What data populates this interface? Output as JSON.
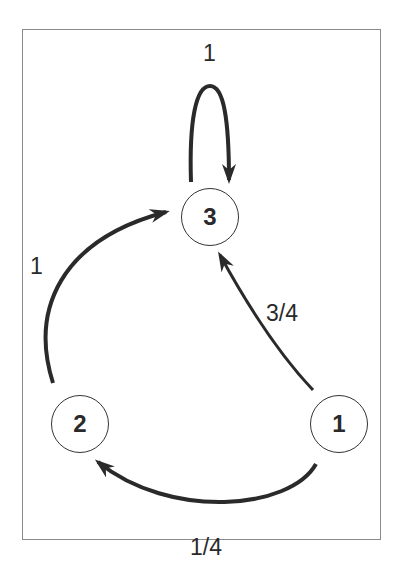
{
  "diagram": {
    "type": "markov-chain-state-diagram",
    "nodes": [
      {
        "id": "1",
        "label": "1"
      },
      {
        "id": "2",
        "label": "2"
      },
      {
        "id": "3",
        "label": "3"
      }
    ],
    "edges": [
      {
        "from": "3",
        "to": "3",
        "label": "1"
      },
      {
        "from": "2",
        "to": "3",
        "label": "1"
      },
      {
        "from": "1",
        "to": "3",
        "label": "3/4"
      },
      {
        "from": "1",
        "to": "2",
        "label": "1/4"
      }
    ],
    "colors": {
      "stroke": "#2a2a2a",
      "frame": "#8a8a8a",
      "background": "#ffffff"
    }
  }
}
